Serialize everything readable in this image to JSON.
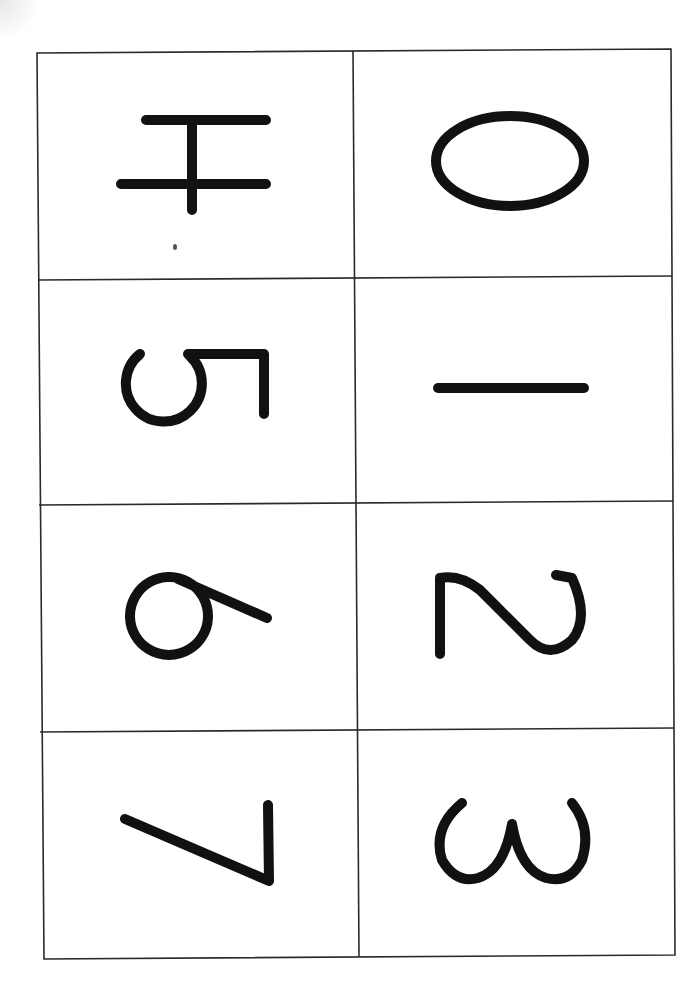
{
  "sheet": {
    "title": "Number cards 0-7",
    "layout": {
      "columns": 2,
      "rows": 4,
      "rotation_deg": 90
    },
    "line_color": "#2a2a2a",
    "ink_color": "#111111",
    "cards": [
      {
        "position": "row1-left",
        "digit": "4"
      },
      {
        "position": "row1-right",
        "digit": "0"
      },
      {
        "position": "row2-left",
        "digit": "5"
      },
      {
        "position": "row2-right",
        "digit": "1"
      },
      {
        "position": "row3-left",
        "digit": "6"
      },
      {
        "position": "row3-right",
        "digit": "2"
      },
      {
        "position": "row4-left",
        "digit": "7"
      },
      {
        "position": "row4-right",
        "digit": "3"
      }
    ]
  }
}
